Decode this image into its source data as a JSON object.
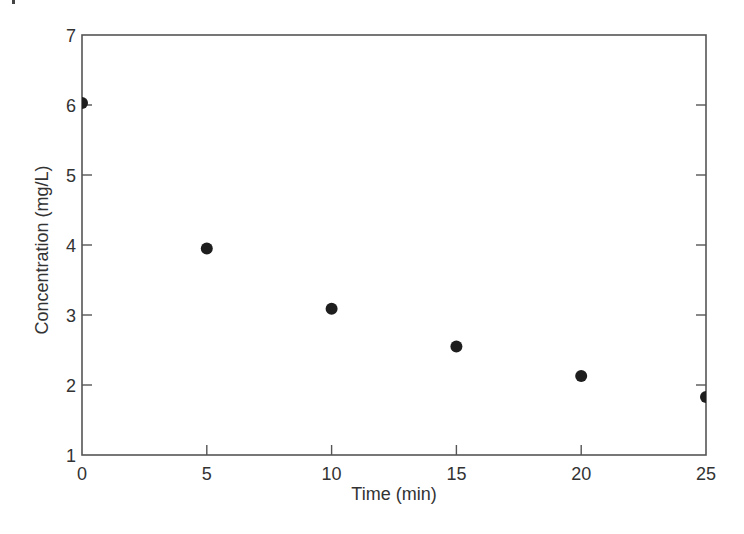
{
  "chart_data": {
    "type": "scatter",
    "title": "",
    "xlabel": "Time (min)",
    "ylabel": "Concentration (mg/L)",
    "xlim": [
      0,
      25
    ],
    "ylim": [
      1,
      7
    ],
    "xticks": [
      0,
      5,
      10,
      15,
      20,
      25
    ],
    "yticks": [
      1,
      2,
      3,
      4,
      5,
      6,
      7
    ],
    "grid": false,
    "legend": null,
    "series": [
      {
        "name": "Concentration",
        "marker": "filled-circle",
        "color": "#1e1e1e",
        "x": [
          0,
          5,
          10,
          15,
          20,
          25
        ],
        "y": [
          6.03,
          3.95,
          3.09,
          2.55,
          2.13,
          1.83
        ]
      }
    ]
  },
  "axes": {
    "x_title": "Time (min)",
    "y_title": "Concentration (mg/L)",
    "x_tick_labels": [
      "0",
      "5",
      "10",
      "15",
      "20",
      "25"
    ],
    "y_tick_labels": [
      "1",
      "2",
      "3",
      "4",
      "5",
      "6",
      "7"
    ]
  },
  "colors": {
    "axis": "#555555",
    "marker": "#1e1e1e",
    "text": "#333333",
    "background": "#ffffff"
  }
}
